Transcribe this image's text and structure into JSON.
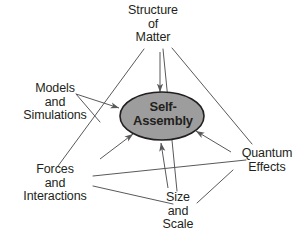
{
  "diagram": {
    "background_color": "#ffffff",
    "line_color": "#58595b",
    "text_color": "#231f20",
    "center": {
      "name": "self-assembly",
      "line1": "Self-",
      "line2": "Assembly",
      "shape": "ellipse",
      "fill_color": "#9d9d9d",
      "stroke_color": "#231f20"
    },
    "nodes": [
      {
        "id": "structure-of-matter",
        "lines": [
          "Structure",
          "of",
          "Matter"
        ],
        "position": "top"
      },
      {
        "id": "models-and-simulations",
        "lines": [
          "Models",
          "and",
          "Simulations"
        ],
        "position": "left"
      },
      {
        "id": "forces-and-interactions",
        "lines": [
          "Forces",
          "and",
          "Interactions"
        ],
        "position": "bottom-left"
      },
      {
        "id": "quantum-effects",
        "lines": [
          "Quantum",
          "Effects"
        ],
        "position": "right"
      },
      {
        "id": "size-and-scale",
        "lines": [
          "Size",
          "and",
          "Scale"
        ],
        "position": "bottom-center"
      }
    ],
    "arrows": [
      {
        "id": "arrow-structure-to-self-assembly",
        "from": "structure-of-matter",
        "to": "self-assembly"
      },
      {
        "id": "arrow-models-to-self-assembly",
        "from": "models-and-simulations",
        "to": "self-assembly"
      },
      {
        "id": "arrow-forces-to-self-assembly",
        "from": "forces-and-interactions",
        "to": "self-assembly"
      },
      {
        "id": "arrow-quantum-to-self-assembly",
        "from": "quantum-effects",
        "to": "self-assembly"
      },
      {
        "id": "arrow-size-to-self-assembly",
        "from": "size-and-scale",
        "to": "self-assembly"
      }
    ],
    "connectors": [
      {
        "id": "edge-structure-forces",
        "from": "structure-of-matter",
        "to": "forces-and-interactions"
      },
      {
        "id": "edge-structure-quantum",
        "from": "structure-of-matter",
        "to": "quantum-effects"
      },
      {
        "id": "edge-forces-quantum",
        "from": "forces-and-interactions",
        "to": "quantum-effects"
      },
      {
        "id": "edge-structure-size",
        "from": "structure-of-matter",
        "to": "size-and-scale"
      },
      {
        "id": "edge-forces-size",
        "from": "forces-and-interactions",
        "to": "size-and-scale"
      },
      {
        "id": "edge-quantum-size",
        "from": "quantum-effects",
        "to": "size-and-scale"
      },
      {
        "id": "edge-models-forces",
        "from": "models-and-simulations",
        "to": "forces-and-interactions"
      }
    ]
  }
}
